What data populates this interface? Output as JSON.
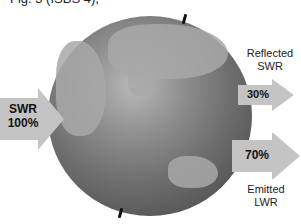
{
  "caption": "Fig. 3 (ISBS 4),",
  "diagram": {
    "center": "Earth",
    "incoming": {
      "name": "SWR",
      "percent": "100%"
    },
    "reflected": {
      "label_line1": "Reflected",
      "label_line2": "SWR",
      "percent": "30%"
    },
    "emitted": {
      "label_line1": "Emitted",
      "label_line2": "LWR",
      "percent": "70%"
    }
  },
  "colors": {
    "arrow": "#c4c4c4",
    "globe": "#6e6e6e"
  }
}
